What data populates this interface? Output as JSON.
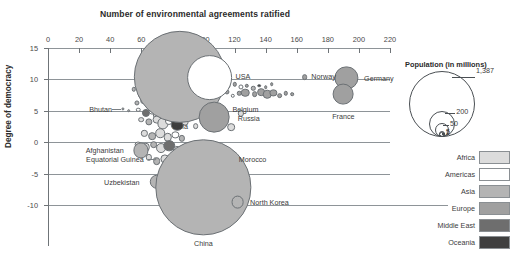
{
  "chart_data": {
    "type": "scatter",
    "title": "Number of environmental agreements ratified",
    "xlabel": "Number of environmental agreements ratified",
    "ylabel": "Degree of democracy",
    "xlim": [
      0,
      220
    ],
    "ylim": [
      -12.5,
      15
    ],
    "xticks": [
      0,
      20,
      40,
      60,
      80,
      100,
      120,
      140,
      160,
      180,
      200,
      220
    ],
    "yticks": [
      15,
      10,
      5,
      0,
      -5,
      -10
    ],
    "grid": "horizontal",
    "legend_position": "right",
    "size_encoding": "Population (in millions)",
    "color_encoding": "Region",
    "points": [
      {
        "label": "India",
        "x": 85,
        "y": 10.4,
        "pop": 1300,
        "region": "Asia"
      },
      {
        "label": "USA",
        "x": 104,
        "y": 10.3,
        "pop": 320,
        "region": "Americas"
      },
      {
        "label": "Norway",
        "x": 165,
        "y": 10.4,
        "pop": 5,
        "region": "Europe"
      },
      {
        "label": "Germany",
        "x": 192,
        "y": 10.2,
        "pop": 82,
        "region": "Europe"
      },
      {
        "label": "France",
        "x": 190,
        "y": 7.6,
        "pop": 66,
        "region": "Europe"
      },
      {
        "label": "Belgium",
        "x": 127,
        "y": 7.9,
        "pop": 11,
        "region": "Europe"
      },
      {
        "label": "Russia",
        "x": 107,
        "y": 4.0,
        "pop": 144,
        "region": "Europe"
      },
      {
        "label": "Bhutan",
        "x": 48,
        "y": 5.3,
        "pop": 1,
        "region": "Asia"
      },
      {
        "label": "Morocco",
        "x": 114,
        "y": -2.6,
        "pop": 35,
        "region": "Africa"
      },
      {
        "label": "Afghanistan",
        "x": 60,
        "y": -1.3,
        "pop": 35,
        "region": "Asia"
      },
      {
        "label": "Equatorial Guinea",
        "x": 69,
        "y": -2.6,
        "pop": 1,
        "region": "Africa"
      },
      {
        "label": "Uzbekistan",
        "x": 70,
        "y": -6.3,
        "pop": 32,
        "region": "Asia"
      },
      {
        "label": "China",
        "x": 100,
        "y": -7.2,
        "pop": 1387,
        "region": "Asia"
      },
      {
        "label": "North Korea",
        "x": 122,
        "y": -9.6,
        "pop": 25,
        "region": "Asia"
      }
    ]
  },
  "population_legend": {
    "title": "Population (in millions)",
    "values": [
      "1,387",
      "200",
      "50",
      "5",
      "1"
    ]
  },
  "region_legend": {
    "items": [
      {
        "name": "Africa",
        "color": "#dcdcdc"
      },
      {
        "name": "Americas",
        "color": "#ffffff"
      },
      {
        "name": "Asia",
        "color": "#b4b4b4"
      },
      {
        "name": "Europe",
        "color": "#a0a0a0"
      },
      {
        "name": "Middle East",
        "color": "#6e6e6e"
      },
      {
        "name": "Oceania",
        "color": "#3f3f3f"
      }
    ]
  },
  "axes": {
    "x_title": "Number of environmental agreements ratified",
    "y_title": "Degree of democracy",
    "x_ticks": [
      "0",
      "20",
      "40",
      "60",
      "80",
      "100",
      "120",
      "140",
      "160",
      "180",
      "200",
      "220"
    ],
    "y_ticks": [
      "15",
      "10",
      "5",
      "0",
      "-5",
      "-10"
    ]
  },
  "cloud": {
    "comment": "unlabelled background bubbles of the scatter cloud",
    "points": [
      [
        82,
        13.0,
        5,
        "Asia"
      ],
      [
        89,
        12.4,
        4,
        "Europe"
      ],
      [
        77,
        11.6,
        6,
        "Europe"
      ],
      [
        70,
        10.8,
        22,
        "Europe"
      ],
      [
        73,
        9.4,
        30,
        "Europe"
      ],
      [
        64,
        9.0,
        16,
        "Africa"
      ],
      [
        93,
        9.2,
        14,
        "Americas"
      ],
      [
        97,
        10.0,
        9,
        "Europe"
      ],
      [
        100,
        9.4,
        7,
        "Europe"
      ],
      [
        108,
        9.0,
        6,
        "Europe"
      ],
      [
        112,
        9.4,
        5,
        "Europe"
      ],
      [
        116,
        9.0,
        4,
        "Europe"
      ],
      [
        120,
        9.2,
        3,
        "Europe"
      ],
      [
        124,
        8.8,
        4,
        "Americas"
      ],
      [
        128,
        9.0,
        3,
        "Europe"
      ],
      [
        132,
        8.6,
        3,
        "Asia"
      ],
      [
        136,
        9.0,
        2,
        "Oceania"
      ],
      [
        140,
        8.8,
        2,
        "Europe"
      ],
      [
        144,
        9.2,
        2,
        "Europe"
      ],
      [
        55,
        8.4,
        3,
        "Asia"
      ],
      [
        60,
        7.6,
        6,
        "Asia"
      ],
      [
        66,
        8.2,
        11,
        "Americas"
      ],
      [
        69,
        7.4,
        20,
        "Europe"
      ],
      [
        75,
        8.0,
        26,
        "Americas"
      ],
      [
        79,
        7.6,
        18,
        "Europe"
      ],
      [
        84,
        8.4,
        15,
        "Asia"
      ],
      [
        88,
        7.8,
        12,
        "Americas"
      ],
      [
        92,
        8.2,
        10,
        "Europe"
      ],
      [
        96,
        7.4,
        8,
        "Europe"
      ],
      [
        101,
        7.8,
        7,
        "Europe"
      ],
      [
        105,
        8.0,
        6,
        "Americas"
      ],
      [
        110,
        7.6,
        5,
        "Europe"
      ],
      [
        115,
        8.0,
        4,
        "Europe"
      ],
      [
        119,
        7.4,
        3,
        "Americas"
      ],
      [
        123,
        7.8,
        3,
        "Europe"
      ],
      [
        133,
        7.6,
        5,
        "Europe"
      ],
      [
        137,
        8.0,
        9,
        "Europe"
      ],
      [
        141,
        7.6,
        11,
        "Europe"
      ],
      [
        145,
        7.8,
        8,
        "Europe"
      ],
      [
        149,
        7.4,
        5,
        "Europe"
      ],
      [
        153,
        7.8,
        3,
        "Europe"
      ],
      [
        157,
        7.6,
        2,
        "Europe"
      ],
      [
        57,
        6.2,
        4,
        "Asia"
      ],
      [
        62,
        6.6,
        9,
        "Americas"
      ],
      [
        66,
        5.8,
        14,
        "Africa"
      ],
      [
        70,
        6.2,
        6,
        "Americas"
      ],
      [
        74,
        6.6,
        17,
        "Americas"
      ],
      [
        78,
        6.0,
        12,
        "Asia"
      ],
      [
        82,
        6.4,
        20,
        "Americas"
      ],
      [
        86,
        5.8,
        9,
        "Europe"
      ],
      [
        90,
        6.2,
        7,
        "Africa"
      ],
      [
        94,
        6.0,
        5,
        "Americas"
      ],
      [
        99,
        6.4,
        4,
        "Europe"
      ],
      [
        103,
        6.0,
        3,
        "Americas"
      ],
      [
        52,
        5.0,
        2,
        "Asia"
      ],
      [
        58,
        5.2,
        3,
        "Americas"
      ],
      [
        63,
        4.6,
        10,
        "Middle East"
      ],
      [
        67,
        5.0,
        7,
        "Americas"
      ],
      [
        71,
        4.4,
        16,
        "Africa"
      ],
      [
        76,
        5.2,
        13,
        "Americas"
      ],
      [
        80,
        4.6,
        9,
        "Asia"
      ],
      [
        84,
        5.0,
        7,
        "Africa"
      ],
      [
        88,
        4.4,
        6,
        "Americas"
      ],
      [
        92,
        4.8,
        5,
        "Africa"
      ],
      [
        97,
        4.4,
        4,
        "Asia"
      ],
      [
        124,
        4.6,
        6,
        "Africa"
      ],
      [
        60,
        3.6,
        5,
        "Africa"
      ],
      [
        65,
        3.2,
        8,
        "Asia"
      ],
      [
        70,
        3.6,
        12,
        "Africa"
      ],
      [
        74,
        3.0,
        19,
        "Africa"
      ],
      [
        78,
        3.4,
        10,
        "Americas"
      ],
      [
        83,
        2.8,
        24,
        "Oceania"
      ],
      [
        88,
        3.2,
        7,
        "Africa"
      ],
      [
        95,
        2.6,
        5,
        "Africa"
      ],
      [
        118,
        2.4,
        9,
        "Africa"
      ],
      [
        62,
        1.4,
        6,
        "Africa"
      ],
      [
        67,
        1.0,
        9,
        "Asia"
      ],
      [
        72,
        1.4,
        14,
        "Africa"
      ],
      [
        77,
        0.8,
        11,
        "Africa"
      ],
      [
        82,
        1.2,
        8,
        "Americas"
      ],
      [
        86,
        0.6,
        6,
        "Asia"
      ],
      [
        58,
        -0.4,
        7,
        "Africa"
      ],
      [
        63,
        -0.8,
        11,
        "Africa"
      ],
      [
        68,
        -0.4,
        9,
        "Asia"
      ],
      [
        73,
        -1.0,
        15,
        "Africa"
      ],
      [
        78,
        -0.6,
        20,
        "Middle East"
      ],
      [
        83,
        -1.2,
        10,
        "Africa"
      ],
      [
        88,
        -0.8,
        7,
        "Asia"
      ],
      [
        93,
        -1.4,
        6,
        "Middle East"
      ],
      [
        98,
        -1.0,
        5,
        "Africa"
      ],
      [
        104,
        -1.6,
        13,
        "Africa"
      ],
      [
        109,
        -1.2,
        8,
        "Middle East"
      ],
      [
        65,
        -2.4,
        6,
        "Africa"
      ],
      [
        70,
        -3.0,
        9,
        "Asia"
      ],
      [
        75,
        -2.6,
        13,
        "Africa"
      ],
      [
        80,
        -3.2,
        8,
        "Middle East"
      ],
      [
        85,
        -2.8,
        7,
        "Africa"
      ],
      [
        90,
        -3.4,
        11,
        "Africa"
      ],
      [
        95,
        -3.0,
        18,
        "Africa"
      ],
      [
        110,
        -3.6,
        9,
        "Middle East"
      ],
      [
        115,
        -3.2,
        6,
        "Africa"
      ],
      [
        74,
        -4.6,
        5,
        "Oceania"
      ],
      [
        79,
        -5.0,
        8,
        "Middle East"
      ],
      [
        84,
        -4.4,
        12,
        "Asia"
      ],
      [
        89,
        -5.2,
        7,
        "Oceania"
      ],
      [
        94,
        -4.8,
        16,
        "Asia"
      ],
      [
        113,
        -4.6,
        5,
        "Asia"
      ],
      [
        118,
        -5.2,
        4,
        "Middle East"
      ],
      [
        81,
        -6.0,
        9,
        "Oceania"
      ],
      [
        86,
        -6.6,
        7,
        "Middle East"
      ],
      [
        91,
        -6.0,
        11,
        "Asia"
      ],
      [
        77,
        -5.6,
        6,
        "Oceania"
      ],
      [
        120,
        -6.4,
        5,
        "Asia"
      ],
      [
        125,
        -5.8,
        4,
        "Middle East"
      ]
    ]
  }
}
